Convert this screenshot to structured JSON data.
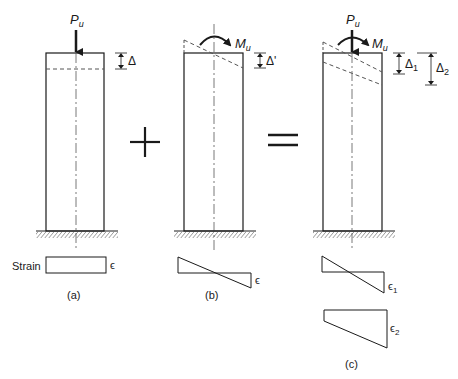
{
  "panels": [
    {
      "id": "a",
      "caption": "(a)",
      "load_label": "P",
      "load_sub": "u",
      "disp_label": "Δ",
      "strain_label": "Strain",
      "strain_symbol": "ϵ"
    },
    {
      "id": "b",
      "caption": "(b)",
      "moment_label": "M",
      "moment_sub": "u",
      "disp_label": "Δ'",
      "strain_symbol": "ϵ"
    },
    {
      "id": "c",
      "caption": "(c)",
      "load_label": "P",
      "load_sub": "u",
      "moment_label": "M",
      "moment_sub": "u",
      "disp1_label": "Δ",
      "disp1_sub": "1",
      "disp2_label": "Δ",
      "disp2_sub": "2",
      "strain1_symbol": "ϵ",
      "strain1_sub": "1",
      "strain2_symbol": "ϵ",
      "strain2_sub": "2"
    }
  ],
  "operators": {
    "plus": "+",
    "equals": "="
  },
  "colors": {
    "line": "#1a1a1a",
    "dash": "#555555"
  }
}
